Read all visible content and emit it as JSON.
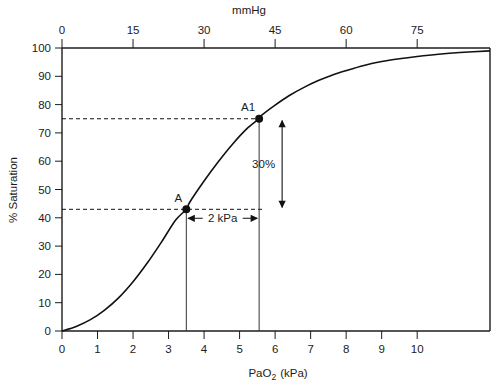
{
  "chart_data": {
    "type": "line",
    "title": "",
    "xlabel": "PaO2 (kPa)",
    "xlabel_base": "PaO",
    "xlabel_sub": "2",
    "xlabel_unit": "(kPa)",
    "ylabel": "% Saturation",
    "top_axis_label": "mmHg",
    "xlim": [
      0,
      12.05
    ],
    "ylim": [
      0,
      100
    ],
    "x_ticks": [
      0,
      1,
      2,
      3,
      4,
      5,
      6,
      7,
      8,
      9,
      10
    ],
    "x_tick_labels": [
      "0",
      "1",
      "2",
      "3",
      "4",
      "5",
      "6",
      "7",
      "8",
      "9",
      "10"
    ],
    "y_ticks": [
      0,
      10,
      20,
      30,
      40,
      50,
      60,
      70,
      80,
      90,
      100
    ],
    "y_tick_labels": [
      "0",
      "10",
      "20",
      "30",
      "40",
      "50",
      "60",
      "70",
      "80",
      "90",
      "100"
    ],
    "top_ticks_mmhg": [
      0,
      15,
      30,
      45,
      60,
      75
    ],
    "top_tick_labels": [
      "0",
      "15",
      "30",
      "45",
      "60",
      "75"
    ],
    "mmhg_per_kpa": 7.5,
    "grid": false,
    "legend": "none",
    "series": [
      {
        "name": "Oxygen-haemoglobin dissociation curve",
        "x": [
          0.0,
          0.4,
          0.8,
          1.2,
          1.6,
          2.0,
          2.4,
          2.8,
          3.2,
          3.5,
          3.6,
          4.0,
          4.4,
          4.8,
          5.2,
          5.55,
          5.6,
          6.0,
          6.4,
          6.8,
          7.2,
          7.6,
          8.0,
          8.5,
          9.0,
          9.5,
          10.0,
          10.6,
          11.2,
          12.05
        ],
        "y": [
          0.0,
          1.6,
          4.0,
          7.4,
          11.8,
          17.4,
          24.0,
          31.4,
          39.2,
          43.0,
          45.6,
          53.0,
          59.8,
          66.0,
          71.4,
          75.0,
          76.0,
          79.8,
          83.2,
          86.0,
          88.4,
          90.4,
          92.0,
          93.8,
          95.2,
          96.2,
          97.0,
          97.8,
          98.4,
          99.0
        ]
      }
    ],
    "points": [
      {
        "id": "A",
        "label": "A",
        "x_kpa": 3.5,
        "y_sat": 43
      },
      {
        "id": "A1",
        "label": "A1",
        "x_kpa": 5.55,
        "y_sat": 75
      }
    ],
    "annotations": [
      {
        "id": "saturation-delta",
        "label": "30%",
        "type": "vertical-double-arrow",
        "from_sat": 43,
        "to_sat": 75
      },
      {
        "id": "pressure-delta",
        "label": "2 kPa",
        "type": "horizontal-double-arrow",
        "from_kpa": 3.5,
        "to_kpa": 5.55
      }
    ],
    "colors": {
      "curve": "#111111",
      "axis": "#1c1c1c",
      "dashed": "#111111",
      "background": "#ffffff"
    }
  }
}
